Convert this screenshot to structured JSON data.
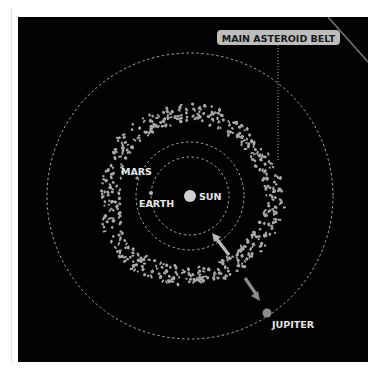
{
  "diagram": {
    "callout": {
      "label": "MAIN ASTEROID BELT"
    },
    "bodies": [
      {
        "name": "sun",
        "label": "SUN"
      },
      {
        "name": "earth",
        "label": "EARTH"
      },
      {
        "name": "mars",
        "label": "MARS"
      },
      {
        "name": "jupiter",
        "label": "JUPITER"
      }
    ],
    "colors": {
      "background": "#020202",
      "orbit": "#cfcfcf",
      "asteroid": "#a9a9a9",
      "label": "#e6e6e6",
      "callout_bg": "#bdbdbd",
      "arrow_inner": "#b9b9b9",
      "arrow_outer": "#8a8a8a",
      "jupiter": "#8e8e8e"
    }
  }
}
